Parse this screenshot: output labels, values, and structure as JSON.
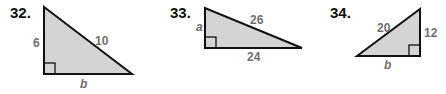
{
  "problems": [
    {
      "number": "32.",
      "leg_vertical": "6",
      "hypotenuse": "10",
      "leg_horizontal": "b"
    },
    {
      "number": "33.",
      "leg_vertical": "a",
      "hypotenuse": "26",
      "leg_horizontal": "24"
    },
    {
      "number": "34.",
      "leg_vertical": "12",
      "hypotenuse": "20",
      "leg_horizontal": "b"
    }
  ],
  "colors": {
    "fill": "#d4d4d4",
    "stroke": "#111111",
    "label": "#6f6f6f"
  }
}
